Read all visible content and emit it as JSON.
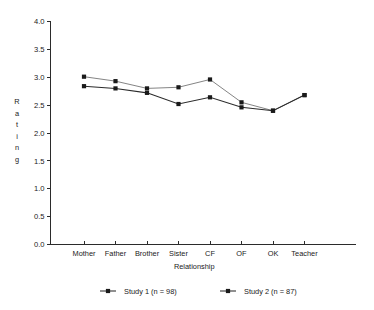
{
  "chart_data": {
    "type": "line",
    "title": "",
    "xlabel": "Relationship",
    "ylabel": "Rating",
    "ylabel_letters": [
      "R",
      "a",
      "t",
      "i",
      "n",
      "g"
    ],
    "categories": [
      "Mother",
      "Father",
      "Brother",
      "Sister",
      "CF",
      "OF",
      "OK",
      "Teacher"
    ],
    "ylim": [
      0.0,
      4.0
    ],
    "ytick_labels": [
      "0.0",
      "0.5",
      "1.0",
      "1.5",
      "2.0",
      "2.5",
      "3.0",
      "3.5",
      "4.0"
    ],
    "ytick_values": [
      0.0,
      0.5,
      1.0,
      1.5,
      2.0,
      2.5,
      3.0,
      3.5,
      4.0
    ],
    "grid": false,
    "legend_position": "bottom",
    "series": [
      {
        "name": "Study 1 (n = 98)",
        "marker": "square",
        "color": "#1a1a1a",
        "values": [
          2.84,
          2.8,
          2.72,
          2.52,
          2.64,
          2.46,
          2.4,
          2.68
        ]
      },
      {
        "name": "Study 2 (n = 87)",
        "marker": "square",
        "color": "#1a1a1a",
        "values": [
          3.01,
          2.93,
          2.8,
          2.82,
          2.96,
          2.55,
          2.4,
          2.68
        ]
      }
    ]
  }
}
